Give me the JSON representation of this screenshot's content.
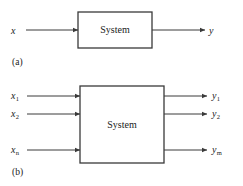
{
  "figure": {
    "background_color": "#ffffff",
    "stroke_color": "#3a3a3a",
    "text_color": "#1a1a1a"
  },
  "panel_a": {
    "caption": "(a)",
    "block_label": "System",
    "box": {
      "x": 78,
      "y": 12,
      "width": 74,
      "height": 36
    },
    "inputs": [
      {
        "label": "x",
        "sub": "",
        "label_x": 11,
        "label_y": 26,
        "line_x1": 26,
        "line_x2": 78,
        "y": 30
      }
    ],
    "outputs": [
      {
        "label": "y",
        "sub": "",
        "label_x": 209,
        "label_y": 26,
        "line_x1": 152,
        "line_x2": 205,
        "y": 30
      }
    ]
  },
  "panel_b": {
    "caption": "(b)",
    "block_label": "System",
    "box": {
      "x": 80,
      "y": 86,
      "width": 84,
      "height": 77
    },
    "inputs": [
      {
        "label": "x",
        "sub": "1",
        "label_x": 11,
        "label_y": 91,
        "line_x1": 27,
        "line_x2": 80,
        "y": 96
      },
      {
        "label": "x",
        "sub": "2",
        "label_x": 11,
        "label_y": 109,
        "line_x1": 27,
        "line_x2": 80,
        "y": 114
      },
      {
        "label": "x",
        "sub": "n",
        "label_x": 11,
        "label_y": 145,
        "line_x1": 27,
        "line_x2": 80,
        "y": 150
      }
    ],
    "outputs": [
      {
        "label": "y",
        "sub": "1",
        "label_x": 212,
        "label_y": 91,
        "line_x1": 164,
        "line_x2": 207,
        "y": 96
      },
      {
        "label": "y",
        "sub": "2",
        "label_x": 212,
        "label_y": 109,
        "line_x1": 164,
        "line_x2": 207,
        "y": 114
      },
      {
        "label": "y",
        "sub": "m",
        "label_x": 212,
        "label_y": 145,
        "line_x1": 164,
        "line_x2": 207,
        "y": 150
      }
    ]
  },
  "captions": {
    "a_x": 12,
    "a_y": 58,
    "b_x": 12,
    "b_y": 168
  }
}
